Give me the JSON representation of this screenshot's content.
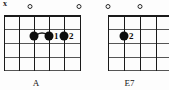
{
  "diagram": {
    "type": "guitar-chord-chart",
    "chords": [
      {
        "id": "a",
        "name": "A",
        "string_markers": [
          {
            "string": 1,
            "symbol": "x",
            "type": "muted"
          },
          {
            "string": 2,
            "symbol": "o",
            "type": "open"
          },
          {
            "string": 6,
            "symbol": "o",
            "type": "open"
          }
        ],
        "fingerings": [
          {
            "string": 3,
            "fret": 2,
            "finger": ""
          },
          {
            "string": 4,
            "fret": 2,
            "finger": "1"
          },
          {
            "string": 5,
            "fret": 2,
            "finger": "2"
          }
        ],
        "slur": {
          "from_string": 3,
          "to_string": 4,
          "fret": 2
        },
        "frets": 4,
        "strings": 6
      },
      {
        "id": "e7",
        "name": "E7",
        "string_markers": [
          {
            "string": 1,
            "symbol": "o",
            "type": "open"
          },
          {
            "string": 3,
            "symbol": "o",
            "type": "open"
          }
        ],
        "fingerings": [
          {
            "string": 2,
            "fret": 2,
            "finger": "2"
          }
        ],
        "frets": 4,
        "strings": 4
      }
    ]
  },
  "colors": {
    "ink": "#0d0d0d",
    "fret_line": "#555555",
    "string_line": "#1a1a1a",
    "background": "#fdfdfd"
  }
}
